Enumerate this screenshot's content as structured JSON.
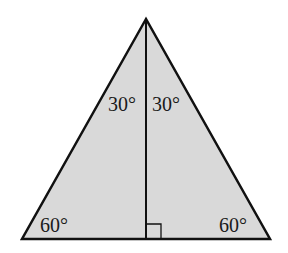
{
  "diagram": {
    "type": "equilateral-triangle-with-altitude",
    "fill_color": "#d9d9d9",
    "stroke_color": "#111111",
    "vertices": {
      "apex": [
        146,
        19
      ],
      "base_left": [
        22,
        239
      ],
      "base_right": [
        270,
        239
      ]
    },
    "altitude": {
      "from": [
        146,
        19
      ],
      "to": [
        146,
        239
      ]
    },
    "right_angle_marker": {
      "x": 146,
      "y": 224,
      "size": 15
    },
    "angle_labels": {
      "apex_left": "30°",
      "apex_right": "30°",
      "base_left": "60°",
      "base_right": "60°"
    }
  }
}
